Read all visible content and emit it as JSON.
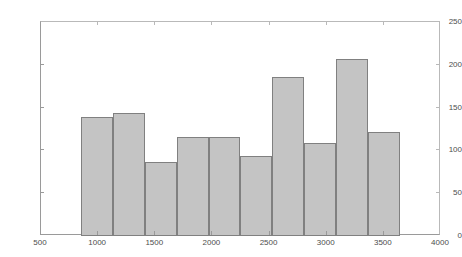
{
  "chart_data": {
    "type": "bar",
    "title": "",
    "subtitle": "",
    "xlabel": "",
    "ylabel": "",
    "xlim": [
      500,
      4000
    ],
    "ylim": [
      0,
      250
    ],
    "grid": false,
    "legend": false,
    "bar_color": "#c4c4c4",
    "bar_edge_color": "#808080",
    "axis_color": "#9a9a9a",
    "bin_edges": [
      850,
      1129,
      1408,
      1687,
      1966,
      2245,
      2524,
      2803,
      3082,
      3361,
      3640
    ],
    "categories": [
      "850-1129",
      "1129-1408",
      "1408-1687",
      "1687-1966",
      "1966-2245",
      "2245-2524",
      "2524-2803",
      "2803-3082",
      "3082-3361",
      "3361-3640"
    ],
    "values": [
      139,
      144,
      86,
      116,
      116,
      93,
      186,
      109,
      207,
      121
    ],
    "xticks": [
      500,
      1000,
      1500,
      2000,
      2500,
      3000,
      3500,
      4000
    ],
    "xtick_labels": [
      "500",
      "1000",
      "1500",
      "2000",
      "2500",
      "3000",
      "3500",
      "4000"
    ],
    "yticks": [
      0,
      50,
      100,
      150,
      200,
      250
    ],
    "ytick_labels": [
      "0",
      "50",
      "100",
      "150",
      "200",
      "250"
    ]
  }
}
